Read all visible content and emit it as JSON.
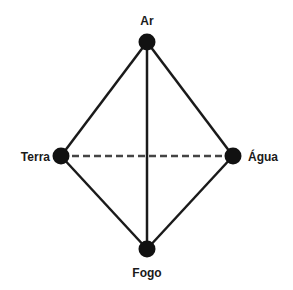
{
  "diagram": {
    "type": "elements-graph",
    "nodes": [
      {
        "id": "ar",
        "label": "Ar",
        "x": 147,
        "y": 42,
        "label_x": 147,
        "label_y": 25,
        "anchor": "middle"
      },
      {
        "id": "terra",
        "label": "Terra",
        "x": 61,
        "y": 156,
        "label_x": 50,
        "label_y": 161,
        "anchor": "end"
      },
      {
        "id": "agua",
        "label": "Água",
        "x": 233,
        "y": 156,
        "label_x": 248,
        "label_y": 161,
        "anchor": "start"
      },
      {
        "id": "fogo",
        "label": "Fogo",
        "x": 147,
        "y": 249,
        "label_x": 147,
        "label_y": 277,
        "anchor": "middle"
      }
    ],
    "edges": [
      {
        "from": "ar",
        "to": "terra",
        "style": "solid"
      },
      {
        "from": "ar",
        "to": "agua",
        "style": "solid"
      },
      {
        "from": "ar",
        "to": "fogo",
        "style": "solid"
      },
      {
        "from": "terra",
        "to": "fogo",
        "style": "solid"
      },
      {
        "from": "agua",
        "to": "fogo",
        "style": "solid"
      },
      {
        "from": "terra",
        "to": "agua",
        "style": "dashed"
      }
    ],
    "colors": {
      "line": "#1a1a1a",
      "node": "#111111",
      "background": "#ffffff"
    }
  }
}
